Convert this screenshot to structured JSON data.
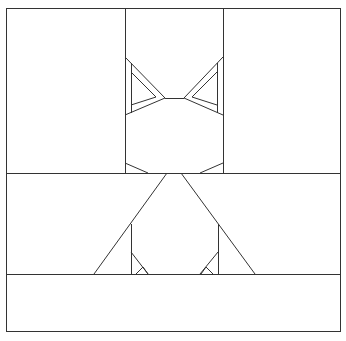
{
  "diagram": {
    "title": "",
    "stroke_color": "#333333",
    "background": "#ffffff",
    "frame": {
      "x": 6,
      "y": 8,
      "w": 335,
      "h": 324
    },
    "regions": [
      {
        "name": "top-left-panel"
      },
      {
        "name": "head-panel"
      },
      {
        "name": "top-right-panel"
      },
      {
        "name": "body-band"
      },
      {
        "name": "bottom-band"
      }
    ]
  }
}
